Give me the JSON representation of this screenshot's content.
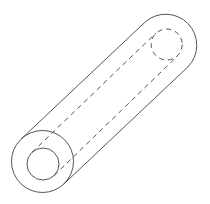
{
  "diagram": {
    "title": "",
    "stroke_color": "#555555",
    "background": "#ffffff",
    "near_end": {
      "cx": 42.5,
      "cy": 161.5,
      "outer_r": 31,
      "inner_r": 16
    },
    "far_end": {
      "cx": 166.5,
      "cy": 44.5,
      "outer_r": 31,
      "inner_r": 15.5
    }
  }
}
